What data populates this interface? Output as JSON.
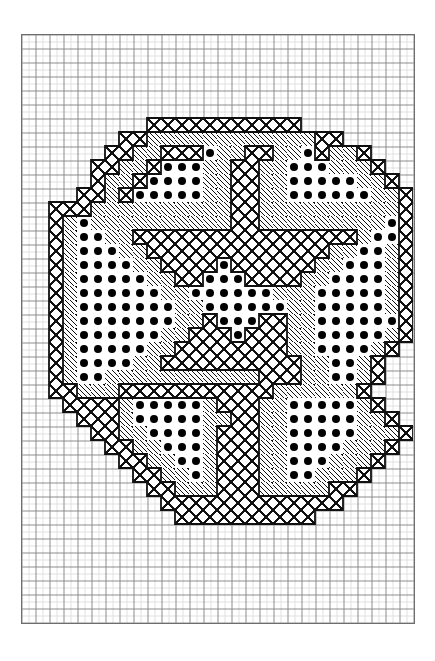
{
  "document": {
    "kind": "cross-stitch-chart",
    "title": "Cross-stitch pattern chart",
    "description": "Octagonal rosette motif charted on graph paper"
  },
  "grid": {
    "columns": 28,
    "rows": 42,
    "cell_px": 14,
    "origin_x": 21,
    "origin_y": 34,
    "line_color": "#7a7a7a",
    "paper_color": "#ffffff"
  },
  "legend": {
    "symbols": [
      {
        "code": "x",
        "name": "cross-hatch-stitch",
        "glyph": "X",
        "color": "#111111"
      },
      {
        "code": "d",
        "name": "diagonal-hatch-stitch",
        "glyph": "/",
        "color": "#111111"
      },
      {
        "code": "o",
        "name": "filled-dot-stitch",
        "glyph": "●",
        "color": "#000000"
      },
      {
        "code": ".",
        "name": "empty-cell",
        "glyph": "",
        "color": "#ffffff"
      }
    ]
  },
  "chart_data": {
    "type": "heatmap",
    "xlabel": "",
    "ylabel": "",
    "grid": true,
    "legend_position": "none",
    "motif_bounds": {
      "col_start": 2,
      "col_end": 26,
      "row_start": 6,
      "row_end": 34
    },
    "symbol_key": {
      "x": "cross-hatch",
      "d": "diagonal-hatch",
      "o": "filled-dot",
      ".": "empty"
    },
    "categories": [
      0,
      1,
      2,
      3,
      4,
      5,
      6,
      7,
      8,
      9,
      10,
      11,
      12,
      13,
      14,
      15,
      16,
      17,
      18,
      19,
      20,
      21,
      22,
      23,
      24,
      25,
      26,
      27
    ],
    "rows": [
      "............................",
      "............................",
      "............................",
      "............................",
      "............................",
      "............................",
      ".........xxxxxxxxxxx........",
      ".......xxddddddddddddxx.....",
      "......xxddxxxoddxxddoxddx...",
      ".....xxddxoooddxxddooodddx..",
      ".....xddxooooddxxddoooooddx.",
      "....xxdxoooooddxxddooooooddx",
      "..xxxddddddddddxxddddddddddx",
      "..xdoddddddddddxxdddddddddox",
      "..xdooddxxxxxxxxxxxxxxxxdoox",
      "..xdoooddxxxxxxxxxxxxxddoodx",
      "..xdooooddxxxxoxxxxxxddooodx",
      "..xdoooooddxxoooxxxxddoooodx",
      "..xdooooooddoooooodddooooodx",
      "..xdoooooooddooooooddooooodx",
      "..xdoooooooddxoooxxddoooooox",
      "..xdooooooddxxxoxxxddooooodx",
      "..xdoooooddxxxxxxxxddoooodx.",
      "..xdooooddxxxxxxxxxxddoodx..",
      "..xdoodddddddddddxxxddoodx..",
      "..xxdddxxxxxxxxxxxddddddx...",
      "...xxxxdooooodxxxddooooodx..",
      "....xxxdoooooddxxddoooooddx.",
      ".....xxddoooodxxxddooooodddx",
      "......xxddooodxxxddoooodddx.",
      ".......xxddoodxxxddooodddx..",
      "........xxddodxxxddoodddx...",
      ".........xxdddxxxdddddxx....",
      "..........xxxxxxxxxxxxx.....",
      "...........xxxxxxxxxx.......",
      "............................",
      "............................",
      "............................",
      "............................",
      "............................",
      "............................",
      "............................"
    ]
  }
}
